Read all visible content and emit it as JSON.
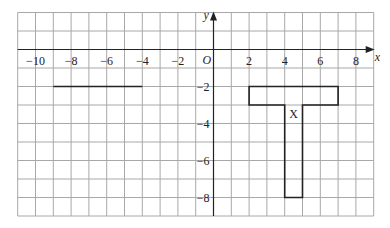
{
  "diagram": {
    "type": "coordinate-grid",
    "x_range": [
      -11,
      9
    ],
    "y_range": [
      -9,
      2
    ],
    "grid_step": 1,
    "axes": {
      "x_label": "x",
      "y_label": "y",
      "origin_label": "O"
    },
    "x_ticks": [
      {
        "value": -10,
        "label": "−10"
      },
      {
        "value": -8,
        "label": "−8"
      },
      {
        "value": -6,
        "label": "−6"
      },
      {
        "value": -4,
        "label": "−4"
      },
      {
        "value": -2,
        "label": "−2"
      },
      {
        "value": 2,
        "label": "2"
      },
      {
        "value": 4,
        "label": "4"
      },
      {
        "value": 6,
        "label": "6"
      },
      {
        "value": 8,
        "label": "8"
      }
    ],
    "y_ticks": [
      {
        "value": -2,
        "label": "−2"
      },
      {
        "value": -4,
        "label": "−4"
      },
      {
        "value": -6,
        "label": "−6"
      },
      {
        "value": -8,
        "label": "−8"
      }
    ],
    "shapes": [
      {
        "name": "X",
        "label": "X",
        "label_pos": [
          4.5,
          -3.5
        ],
        "points": [
          [
            2,
            -2
          ],
          [
            7,
            -2
          ],
          [
            7,
            -3
          ],
          [
            5,
            -3
          ],
          [
            5,
            -8
          ],
          [
            4,
            -8
          ],
          [
            4,
            -3
          ],
          [
            2,
            -3
          ]
        ]
      }
    ],
    "segments": [
      {
        "name": "mirror-line",
        "from": [
          -9,
          -2
        ],
        "to": [
          -4,
          -2
        ]
      }
    ],
    "colors": {
      "grid": "#a8a8a8",
      "axis": "#222222",
      "shape": "#222222",
      "background": "#ffffff"
    }
  }
}
